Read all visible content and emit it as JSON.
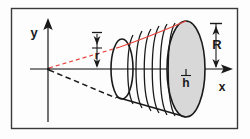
{
  "figure": {
    "background_color": "#fdfdfd",
    "border_color": "#3a3a3a",
    "axis_color": "#5a5a5a",
    "outline_color": "#1a1a1a",
    "highlight_color": "#e8453c",
    "surface_fill": "#d8d8d8",
    "labels": {
      "y_axis": "y",
      "x_axis": "x",
      "small_radius": "r",
      "large_radius": "R",
      "height": "h"
    }
  },
  "geometry": {
    "origin": {
      "x": 48,
      "y": 69
    },
    "apex": {
      "x": 48,
      "y": 69
    },
    "small_disc": {
      "cx": 122,
      "cy": 69,
      "rx": 11,
      "ry": 30
    },
    "large_disc": {
      "cx": 186,
      "cy": 69,
      "rx": 19,
      "ry": 48
    },
    "slice_count": 6,
    "x_axis_extent": [
      30,
      232
    ],
    "y_axis_extent": [
      20,
      122
    ]
  },
  "annotations": {
    "r_measure": {
      "from_y": 40,
      "to_y": 69,
      "at_x": 97,
      "label": "r"
    },
    "R_measure": {
      "from_y": 26,
      "to_y": 69,
      "at_x": 216,
      "label": "R"
    },
    "h_marker": {
      "at_x": 186,
      "at_y": 69,
      "label": "h"
    }
  }
}
